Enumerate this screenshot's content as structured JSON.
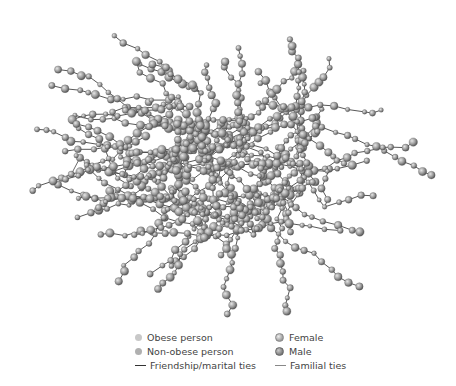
{
  "figure": {
    "type": "social-network-graph",
    "node_color": "#9a9a9a",
    "edge_color": "#444444",
    "center": [
      228,
      165
    ],
    "spread": [
      215,
      155
    ]
  },
  "legend": {
    "items": [
      {
        "id": "obese",
        "label": "Obese person",
        "marker": "dot-light",
        "col": 0,
        "row": 0
      },
      {
        "id": "nonobese",
        "label": "Non-obese person",
        "marker": "dot-mid",
        "col": 0,
        "row": 1
      },
      {
        "id": "friendship",
        "label": "Friendship/marital ties",
        "marker": "line-dark",
        "col": 0,
        "row": 2
      },
      {
        "id": "female",
        "label": "Female",
        "marker": "sphere-light",
        "col": 1,
        "row": 0
      },
      {
        "id": "male",
        "label": "Male",
        "marker": "sphere-dark",
        "col": 1,
        "row": 1
      },
      {
        "id": "familial",
        "label": "Familial ties",
        "marker": "line-gray",
        "col": 1,
        "row": 2
      }
    ]
  }
}
